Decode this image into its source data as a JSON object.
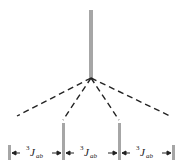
{
  "diagram": {
    "type": "NMR splitting tree (triplet)",
    "colors": {
      "line": "#a6a6a6",
      "dash": "#222222",
      "arrow": "#222222",
      "text": "#222222"
    },
    "parent_peak": "singlet",
    "child_peaks": 4,
    "intensity_ratio": [
      1,
      3,
      3,
      1
    ],
    "couplings": [
      {
        "sup": "3",
        "symbol": "J",
        "sub": "ab"
      },
      {
        "sup": "3",
        "symbol": "J",
        "sub": "ab"
      },
      {
        "sup": "3",
        "symbol": "J",
        "sub": "ab"
      }
    ]
  }
}
